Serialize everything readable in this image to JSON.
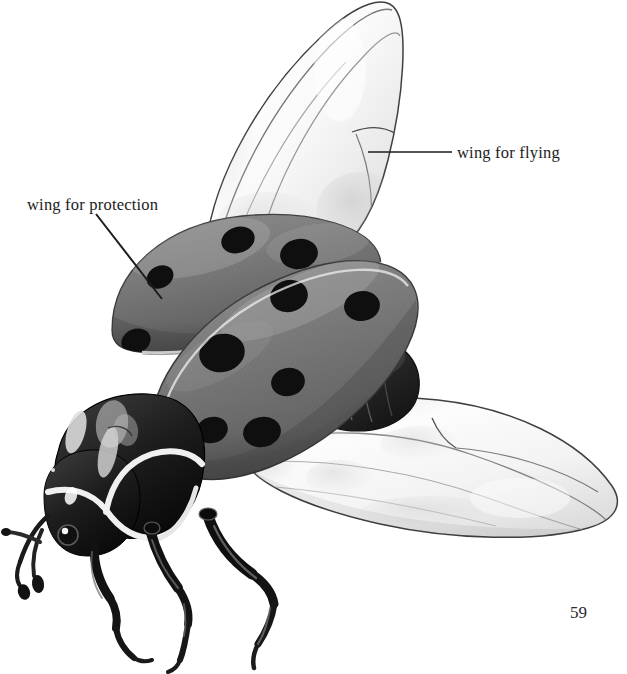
{
  "page": {
    "number": "59",
    "background_color": "#ffffff",
    "width": 627,
    "height": 674
  },
  "illustration": {
    "subject": "ladybug-beetle-anatomy-diagram",
    "style": "grayscale-airbrush-rendering",
    "colors": {
      "elytra_gray": "#7d7d7d",
      "elytra_gray_dark": "#5e5e5e",
      "elytra_gray_light": "#9a9a9a",
      "spot_black": "#111111",
      "body_black": "#1a1a1a",
      "highlight_white": "#f2f2f2",
      "wing_membrane": "#fbfbfb",
      "wing_outline": "#3d3d3d",
      "wing_shadow": "#c9c9c9",
      "leader_line": "#1c1c1c"
    },
    "parts": [
      {
        "name": "upper-flying-wing",
        "description": "translucent hind wing raised upward to the left of center"
      },
      {
        "name": "lower-flying-wing",
        "description": "translucent hind wing spread to the lower right"
      },
      {
        "name": "far-elytron",
        "description": "gray wing cover, upper-left, three black spots visible"
      },
      {
        "name": "near-elytron",
        "description": "gray wing cover, lower-right, six black spots visible"
      },
      {
        "name": "abdomen",
        "description": "dark segmented abdomen between elytra and lower wing"
      },
      {
        "name": "pronotum",
        "description": "black thorax shield with white curved markings"
      },
      {
        "name": "head",
        "description": "black head with white border markings and compound eye"
      },
      {
        "name": "antennae",
        "description": "pair of short clubbed antennae"
      },
      {
        "name": "legs",
        "description": "three visible black jointed legs with claws"
      }
    ],
    "far_elytron_spots": [
      {
        "cx": 238,
        "cy": 240,
        "rx": 17,
        "ry": 13,
        "rot": -18
      },
      {
        "cx": 299,
        "cy": 254,
        "rx": 19,
        "ry": 15,
        "rot": -10
      },
      {
        "cx": 160,
        "cy": 277,
        "rx": 14,
        "ry": 11,
        "rot": -25
      },
      {
        "cx": 136,
        "cy": 341,
        "rx": 14,
        "ry": 12,
        "rot": -20
      }
    ],
    "near_elytron_spots": [
      {
        "cx": 289,
        "cy": 296,
        "rx": 19,
        "ry": 15,
        "rot": -12
      },
      {
        "cx": 362,
        "cy": 306,
        "rx": 18,
        "ry": 15,
        "rot": -8
      },
      {
        "cx": 222,
        "cy": 353,
        "rx": 22,
        "ry": 18,
        "rot": -14
      },
      {
        "cx": 288,
        "cy": 382,
        "rx": 17,
        "ry": 14,
        "rot": -10
      },
      {
        "cx": 212,
        "cy": 430,
        "rx": 16,
        "ry": 13,
        "rot": -14
      },
      {
        "cx": 262,
        "cy": 432,
        "rx": 18,
        "ry": 15,
        "rot": -10
      }
    ]
  },
  "callouts": [
    {
      "id": "flying",
      "label": "wing for flying",
      "leader": {
        "x1": 368,
        "y1": 152,
        "x2": 452,
        "y2": 152,
        "type": "horizontal"
      }
    },
    {
      "id": "protection",
      "label": "wing for protection",
      "leader": {
        "x1": 96,
        "y1": 214,
        "x2": 162,
        "y2": 299,
        "type": "diagonal"
      }
    }
  ]
}
